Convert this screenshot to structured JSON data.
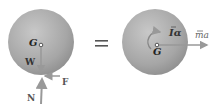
{
  "diagram": {
    "type": "free-body-diagram equals kinetic-diagram",
    "left": {
      "center_label": "G",
      "forces": [
        {
          "label": "W",
          "direction": "down"
        },
        {
          "label": "F",
          "direction": "left"
        },
        {
          "label": "N",
          "direction": "up"
        }
      ]
    },
    "equals": "=",
    "right": {
      "center_label": "G",
      "moment_label": "Iα",
      "force_label": "ma",
      "force_direction": "right"
    },
    "colors": {
      "sphere": "#a8a8a8",
      "arrow": "#9a9a9a",
      "text": "#333333"
    }
  }
}
